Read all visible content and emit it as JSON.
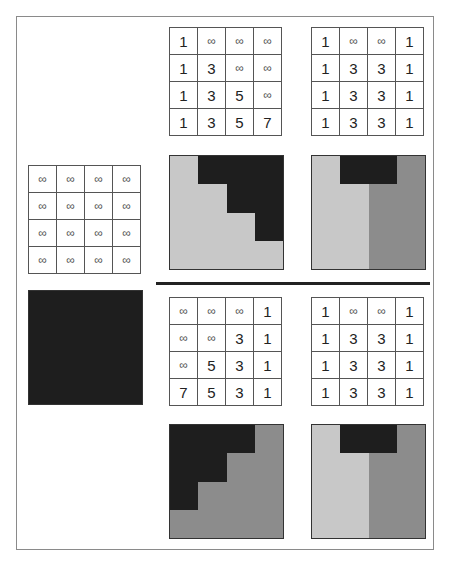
{
  "colors": {
    "dark": "#1e1e1e",
    "light": "#c8c8c8",
    "mid": "#8c8c8c"
  },
  "infinity": "∞",
  "initial_grid": [
    [
      "∞",
      "∞",
      "∞",
      "∞"
    ],
    [
      "∞",
      "∞",
      "∞",
      "∞"
    ],
    [
      "∞",
      "∞",
      "∞",
      "∞"
    ],
    [
      "∞",
      "∞",
      "∞",
      "∞"
    ]
  ],
  "top_left_grid": [
    [
      "1",
      "∞",
      "∞",
      "∞"
    ],
    [
      "1",
      "3",
      "∞",
      "∞"
    ],
    [
      "1",
      "3",
      "5",
      "∞"
    ],
    [
      "1",
      "3",
      "5",
      "7"
    ]
  ],
  "top_right_grid": [
    [
      "1",
      "∞",
      "∞",
      "1"
    ],
    [
      "1",
      "3",
      "3",
      "1"
    ],
    [
      "1",
      "3",
      "3",
      "1"
    ],
    [
      "1",
      "3",
      "3",
      "1"
    ]
  ],
  "bottom_left_grid": [
    [
      "∞",
      "∞",
      "∞",
      "1"
    ],
    [
      "∞",
      "∞",
      "3",
      "1"
    ],
    [
      "∞",
      "5",
      "3",
      "1"
    ],
    [
      "7",
      "5",
      "3",
      "1"
    ]
  ],
  "bottom_right_grid": [
    [
      "1",
      "∞",
      "∞",
      "1"
    ],
    [
      "1",
      "3",
      "3",
      "1"
    ],
    [
      "1",
      "3",
      "3",
      "1"
    ],
    [
      "1",
      "3",
      "3",
      "1"
    ]
  ],
  "images": {
    "initial": [
      [
        "D",
        "D",
        "D",
        "D"
      ],
      [
        "D",
        "D",
        "D",
        "D"
      ],
      [
        "D",
        "D",
        "D",
        "D"
      ],
      [
        "D",
        "D",
        "D",
        "D"
      ]
    ],
    "top_left": [
      [
        "L",
        "D",
        "D",
        "D"
      ],
      [
        "L",
        "L",
        "D",
        "D"
      ],
      [
        "L",
        "L",
        "L",
        "D"
      ],
      [
        "L",
        "L",
        "L",
        "L"
      ]
    ],
    "top_right": [
      [
        "L",
        "D",
        "D",
        "M"
      ],
      [
        "L",
        "L",
        "M",
        "M"
      ],
      [
        "L",
        "L",
        "M",
        "M"
      ],
      [
        "L",
        "L",
        "M",
        "M"
      ]
    ],
    "bottom_left": [
      [
        "D",
        "D",
        "D",
        "M"
      ],
      [
        "D",
        "D",
        "M",
        "M"
      ],
      [
        "D",
        "M",
        "M",
        "M"
      ],
      [
        "M",
        "M",
        "M",
        "M"
      ]
    ],
    "bottom_right": [
      [
        "L",
        "D",
        "D",
        "M"
      ],
      [
        "L",
        "L",
        "M",
        "M"
      ],
      [
        "L",
        "L",
        "M",
        "M"
      ],
      [
        "L",
        "L",
        "M",
        "M"
      ]
    ]
  }
}
